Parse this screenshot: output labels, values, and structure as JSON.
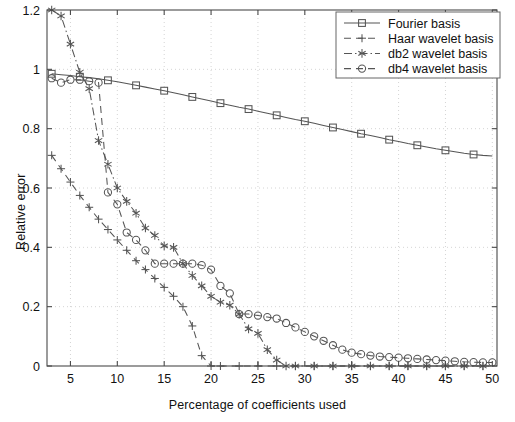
{
  "chart_data": {
    "type": "line",
    "title": "",
    "xlabel": "Percentage of coefficients used",
    "ylabel": "Relative error",
    "xlim": [
      2.5,
      50.5
    ],
    "ylim": [
      0,
      1.2
    ],
    "xticks": [
      5,
      10,
      15,
      20,
      25,
      30,
      35,
      40,
      45,
      50
    ],
    "yticks": [
      0,
      0.2,
      0.4,
      0.6,
      0.8,
      1,
      1.2
    ],
    "ytick_labels": [
      "0",
      "0.2",
      "0.4",
      "0.6",
      "0.8",
      "1",
      "1.2"
    ],
    "xtick_labels": [
      "5",
      "10",
      "15",
      "20",
      "25",
      "30",
      "35",
      "40",
      "45",
      "50"
    ],
    "grid": true,
    "legend_position": "top-right",
    "series": [
      {
        "name": "Fourier basis",
        "marker": "square",
        "linestyle": "solid",
        "x": [
          3,
          4,
          5,
          6,
          7,
          8,
          9,
          10,
          11,
          12,
          13,
          14,
          15,
          16,
          17,
          18,
          19,
          20,
          21,
          22,
          23,
          24,
          25,
          26,
          27,
          28,
          29,
          30,
          31,
          32,
          33,
          34,
          35,
          36,
          37,
          38,
          39,
          40,
          41,
          42,
          43,
          44,
          45,
          46,
          47,
          48,
          49,
          50
        ],
        "y": [
          0.985,
          0.982,
          0.979,
          0.975,
          0.972,
          0.968,
          0.963,
          0.958,
          0.952,
          0.946,
          0.94,
          0.934,
          0.928,
          0.921,
          0.914,
          0.907,
          0.9,
          0.893,
          0.886,
          0.879,
          0.872,
          0.866,
          0.859,
          0.852,
          0.845,
          0.838,
          0.831,
          0.825,
          0.818,
          0.811,
          0.804,
          0.797,
          0.79,
          0.783,
          0.777,
          0.77,
          0.763,
          0.757,
          0.75,
          0.744,
          0.738,
          0.732,
          0.727,
          0.722,
          0.717,
          0.713,
          0.71,
          0.708
        ]
      },
      {
        "name": "Haar wavelet basis",
        "marker": "plus",
        "linestyle": "dashed",
        "x": [
          3,
          4,
          5,
          6,
          7,
          8,
          9,
          10,
          11,
          12,
          13,
          14,
          15,
          16,
          17,
          18,
          19,
          20,
          21,
          22,
          23,
          24,
          25,
          26,
          27,
          28,
          29,
          30,
          31,
          32,
          33,
          34,
          35,
          36,
          37,
          38,
          39,
          40,
          41,
          42,
          43,
          44,
          45,
          46,
          47,
          48,
          49,
          50
        ],
        "y": [
          0.71,
          0.665,
          0.62,
          0.575,
          0.535,
          0.495,
          0.46,
          0.425,
          0.39,
          0.355,
          0.325,
          0.295,
          0.265,
          0.235,
          0.2,
          0.135,
          0.035,
          0,
          0,
          0,
          0,
          0,
          0,
          0,
          0,
          0,
          0,
          0,
          0,
          0,
          0,
          0,
          0,
          0,
          0,
          0,
          0,
          0,
          0,
          0,
          0,
          0,
          0,
          0,
          0,
          0,
          0,
          0
        ]
      },
      {
        "name": "db2 wavelet basis",
        "marker": "star",
        "linestyle": "dashdot",
        "x": [
          3,
          4,
          5,
          6,
          7,
          8,
          9,
          10,
          11,
          12,
          13,
          14,
          15,
          16,
          17,
          18,
          19,
          20,
          21,
          22,
          23,
          24,
          25,
          26,
          27,
          28,
          29,
          30,
          31,
          32,
          33,
          34,
          35,
          36,
          37,
          38,
          39,
          40,
          41,
          42,
          43,
          44,
          45,
          46,
          47,
          48,
          49,
          50
        ],
        "y": [
          1.2,
          1.18,
          1.085,
          0.99,
          0.935,
          0.76,
          0.68,
          0.6,
          0.555,
          0.515,
          0.465,
          0.44,
          0.405,
          0.4,
          0.345,
          0.305,
          0.27,
          0.235,
          0.215,
          0.205,
          0.175,
          0.125,
          0.11,
          0.055,
          0.02,
          0,
          0,
          0,
          0,
          0,
          0,
          0,
          0,
          0,
          0,
          0,
          0,
          0,
          0,
          0,
          0,
          0,
          0,
          0,
          0,
          0,
          0,
          0
        ]
      },
      {
        "name": "db4 wavelet basis",
        "marker": "circle",
        "linestyle": "dashed",
        "x": [
          3,
          4,
          5,
          6,
          7,
          8,
          9,
          10,
          11,
          12,
          13,
          14,
          15,
          16,
          17,
          18,
          19,
          20,
          21,
          22,
          23,
          24,
          25,
          26,
          27,
          28,
          29,
          30,
          31,
          32,
          33,
          34,
          35,
          36,
          37,
          38,
          39,
          40,
          41,
          42,
          43,
          44,
          45,
          46,
          47,
          48,
          49,
          50
        ],
        "y": [
          0.97,
          0.955,
          0.965,
          0.965,
          0.96,
          0.955,
          0.585,
          0.545,
          0.45,
          0.425,
          0.39,
          0.345,
          0.345,
          0.345,
          0.345,
          0.345,
          0.34,
          0.325,
          0.27,
          0.245,
          0.175,
          0.175,
          0.17,
          0.165,
          0.16,
          0.145,
          0.13,
          0.115,
          0.1,
          0.085,
          0.07,
          0.055,
          0.045,
          0.04,
          0.035,
          0.032,
          0.03,
          0.028,
          0.026,
          0.024,
          0.022,
          0.02,
          0.018,
          0.016,
          0.014,
          0.013,
          0.012,
          0.012
        ]
      }
    ]
  },
  "legend": {
    "items": [
      {
        "label": "Fourier basis"
      },
      {
        "label": "Haar wavelet basis"
      },
      {
        "label": "db2 wavelet basis"
      },
      {
        "label": "db4 wavelet basis"
      }
    ]
  }
}
